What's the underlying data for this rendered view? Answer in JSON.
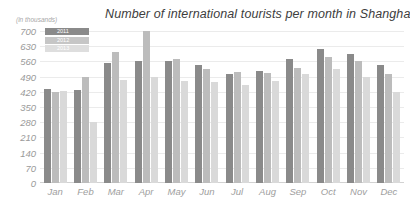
{
  "chart_data": {
    "type": "bar",
    "title": "Number of international tourists per month in Shanghai",
    "unit_note": "(in thousands)",
    "xlabel": "",
    "ylabel": "",
    "ylim": [
      0,
      700
    ],
    "yticks": [
      700,
      630,
      560,
      490,
      420,
      350,
      280,
      210,
      140,
      70,
      0
    ],
    "grid": true,
    "legend_position": "top-left",
    "categories": [
      "Jan",
      "Feb",
      "Mar",
      "Apr",
      "May",
      "Jun",
      "Jul",
      "Aug",
      "Sep",
      "Oct",
      "Nov",
      "Dec"
    ],
    "series": [
      {
        "name": "2011",
        "color": "#8a8a8a",
        "values": [
          435,
          430,
          555,
          560,
          560,
          545,
          500,
          515,
          570,
          615,
          595,
          545
        ]
      },
      {
        "name": "2012",
        "color": "#bcbcbc",
        "values": [
          420,
          490,
          605,
          700,
          570,
          525,
          510,
          505,
          530,
          580,
          560,
          500
        ]
      },
      {
        "name": "2013",
        "color": "#d9d9d9",
        "values": [
          425,
          280,
          475,
          490,
          470,
          465,
          450,
          470,
          500,
          525,
          490,
          420
        ]
      }
    ]
  },
  "colors": {
    "title_text": "#3d3d3d",
    "tick_text": "#9a9a9a",
    "gridline": "#ebebeb",
    "background": "#ffffff"
  }
}
